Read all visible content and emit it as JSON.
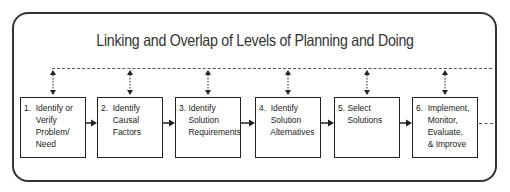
{
  "diagram": {
    "title": "Linking and Overlap of Levels of Planning and Doing",
    "steps": [
      {
        "number": "1.",
        "label": "Identify or\nVerify\nProblem/\nNeed"
      },
      {
        "number": "2.",
        "label": "Identify\nCausal\nFactors"
      },
      {
        "number": "3.",
        "label": "Identify\nSolution\nRequirements"
      },
      {
        "number": "4.",
        "label": "Identify\nSolution\nAlternatives"
      },
      {
        "number": "5.",
        "label": "Select\nSolutions"
      },
      {
        "number": "6.",
        "label": "Implement,\nMonitor,\nEvaluate,\n& Improve"
      }
    ],
    "step_text": [
      "1.  Identify or\n     Verify\n     Problem/\n     Need",
      "2.  Identify\n     Causal\n     Factors",
      "3. Identify\n    Solution\n    Requirements",
      "4.  Identify\n     Solution\n     Alternatives",
      "5. Select\n    Solutions",
      "6.  Implement,\n     Monitor,\n     Evaluate,\n     & Improve"
    ],
    "connectors": {
      "overlap_line": "dashed",
      "vertical_links": "bidirectional-dotted",
      "flow_arrows": "solid",
      "continuation": "dashed"
    },
    "colors": {
      "stroke": "#222222",
      "background": "#ffffff"
    }
  }
}
